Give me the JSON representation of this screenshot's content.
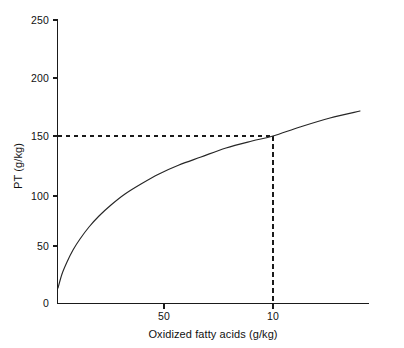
{
  "chart_data": {
    "type": "line",
    "title": "",
    "subtitle": "",
    "xlabel": "Oxidized fatty acids (g/kg)",
    "ylabel": "PT (g/kg)",
    "x_tick_labels": [
      "50",
      "10"
    ],
    "x_tick_values": [
      50,
      10
    ],
    "x_scale_note": "decreasing left-to-right (reciprocal-type axis); only 50 and 10 labelled",
    "y_tick_labels": [
      "0",
      "50",
      "100",
      "150",
      "200",
      "250"
    ],
    "y_tick_values": [
      0,
      50,
      100,
      150,
      200,
      250
    ],
    "ylim": [
      0,
      250
    ],
    "grid": false,
    "legend": null,
    "series": [
      {
        "name": "PT vs oxidized fatty acids",
        "points": [
          {
            "px": 58,
            "py": 288,
            "y": 22
          },
          {
            "px": 62,
            "py": 274,
            "y": 34
          },
          {
            "px": 67,
            "py": 262,
            "y": 45
          },
          {
            "px": 73,
            "py": 250,
            "y": 56
          },
          {
            "px": 80,
            "py": 239,
            "y": 65
          },
          {
            "px": 89,
            "py": 227,
            "y": 76
          },
          {
            "px": 99,
            "py": 216,
            "y": 86
          },
          {
            "px": 111,
            "py": 205,
            "y": 96
          },
          {
            "px": 125,
            "py": 194,
            "y": 106
          },
          {
            "px": 141,
            "py": 184,
            "y": 115
          },
          {
            "px": 159,
            "py": 174,
            "y": 124
          },
          {
            "px": 179,
            "py": 165,
            "y": 132
          },
          {
            "px": 201,
            "py": 157,
            "y": 139
          },
          {
            "px": 226,
            "py": 148,
            "y": 147
          },
          {
            "px": 252,
            "py": 141,
            "y": 153
          },
          {
            "px": 273,
            "py": 136,
            "y": 150
          },
          {
            "px": 300,
            "py": 127,
            "y": 158
          },
          {
            "px": 330,
            "py": 118,
            "y": 166
          },
          {
            "px": 360,
            "py": 111,
            "y": 168
          }
        ]
      }
    ],
    "annotations": [
      {
        "kind": "guide-lines",
        "label": "dashed reference lines at PT = 150 meeting curve at x = 10 g/kg",
        "y_value": 150,
        "x_value": 10
      }
    ]
  },
  "axes": {
    "y_ticks": [
      {
        "label": "250",
        "py": 20
      },
      {
        "label": "200",
        "py": 78
      },
      {
        "label": "150",
        "py": 136
      },
      {
        "label": "100",
        "py": 196
      },
      {
        "label": "50",
        "py": 246
      },
      {
        "label": "0",
        "py": 303
      }
    ],
    "x_ticks": [
      {
        "label": "50",
        "px": 164
      },
      {
        "label": "10",
        "px": 273
      }
    ],
    "y_axis_title": "PT (g/kg)",
    "x_axis_title": "Oxidized fatty acids (g/kg)"
  },
  "style": {
    "background": "#ffffff",
    "line_color": "#262626",
    "axis_color": "#1a1a1a",
    "text_color": "#111111"
  }
}
